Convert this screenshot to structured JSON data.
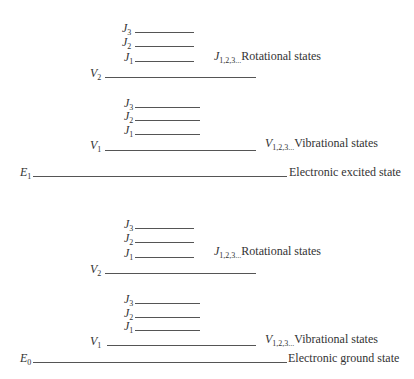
{
  "diagram": {
    "type": "energy-level-diagram",
    "upper_block": {
      "electronic": {
        "symbol": "E",
        "sub": "1",
        "label": "Electronic excited state"
      },
      "vibrational_label": {
        "symbol": "V",
        "sub": "1,2,3...",
        "text": "Vibrational states"
      },
      "rotational_label": {
        "symbol": "J",
        "sub": "1,2,3...",
        "text": "Rotational states"
      },
      "v2": {
        "symbol": "V",
        "sub": "2"
      },
      "v1": {
        "symbol": "V",
        "sub": "1"
      },
      "j_v2": [
        {
          "symbol": "J",
          "sub": "3"
        },
        {
          "symbol": "J",
          "sub": "2"
        },
        {
          "symbol": "J",
          "sub": "1"
        }
      ],
      "j_v1": [
        {
          "symbol": "J",
          "sub": "3"
        },
        {
          "symbol": "J",
          "sub": "2"
        },
        {
          "symbol": "J",
          "sub": "1"
        }
      ]
    },
    "lower_block": {
      "electronic": {
        "symbol": "E",
        "sub": "0",
        "label": "Electronic ground state"
      },
      "vibrational_label": {
        "symbol": "V",
        "sub": "1,2,3...",
        "text": "Vibrational states"
      },
      "rotational_label": {
        "symbol": "J",
        "sub": "1,2,3...",
        "text": "Rotational states"
      },
      "v2": {
        "symbol": "V",
        "sub": "2"
      },
      "v1": {
        "symbol": "V",
        "sub": "1"
      },
      "j_v2": [
        {
          "symbol": "J",
          "sub": "3"
        },
        {
          "symbol": "J",
          "sub": "2"
        },
        {
          "symbol": "J",
          "sub": "1"
        }
      ],
      "j_v1": [
        {
          "symbol": "J",
          "sub": "3"
        },
        {
          "symbol": "J",
          "sub": "2"
        },
        {
          "symbol": "J",
          "sub": "1"
        }
      ]
    }
  }
}
